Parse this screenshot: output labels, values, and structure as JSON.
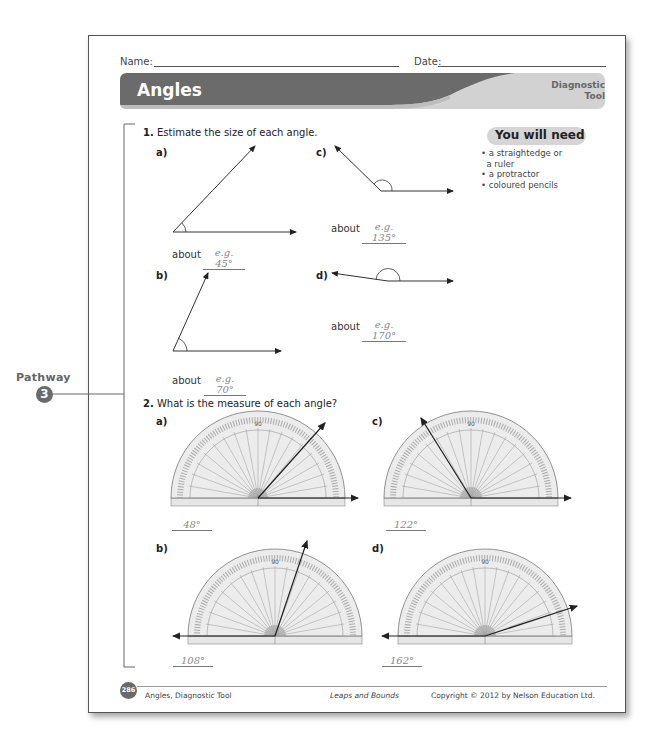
{
  "header": {
    "name_label": "Name:",
    "date_label": "Date:",
    "title": "Angles",
    "subtitle_line1": "Diagnostic",
    "subtitle_line2": "Tool",
    "banner_color": "#6b6b6b",
    "banner_accent": "#d0d0d0"
  },
  "you_will_need": {
    "title": "You will need",
    "items": [
      "a straightedge or",
      "a ruler",
      "a protractor",
      "coloured pencils"
    ]
  },
  "pathway": {
    "label": "Pathway",
    "number": "3"
  },
  "question1": {
    "number": "1.",
    "text": "Estimate the size of each angle.",
    "parts": [
      {
        "label": "a)",
        "about": "about",
        "answer": "e.g. 45°"
      },
      {
        "label": "b)",
        "about": "about",
        "answer": "e.g. 70°"
      },
      {
        "label": "c)",
        "about": "about",
        "answer": "e.g. 135°"
      },
      {
        "label": "d)",
        "about": "about",
        "answer": "e.g. 170°"
      }
    ]
  },
  "question2": {
    "number": "2.",
    "text": "What is the measure of each angle?",
    "parts": [
      {
        "label": "a)",
        "answer": "48°",
        "protractor_center_label": "90"
      },
      {
        "label": "b)",
        "answer": "108°",
        "protractor_center_label": "90"
      },
      {
        "label": "c)",
        "answer": "122°",
        "protractor_center_label": "90"
      },
      {
        "label": "d)",
        "answer": "162°",
        "protractor_center_label": "90"
      }
    ]
  },
  "footer": {
    "page_badge": "286",
    "left": "Angles, Diagnostic Tool",
    "center": "Leaps and Bounds",
    "right": "Copyright © 2012 by Nelson Education Ltd."
  }
}
